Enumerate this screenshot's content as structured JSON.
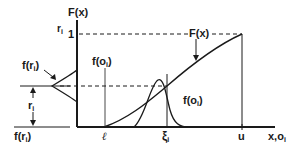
{
  "figure": {
    "type": "cdf-transformation-diagram",
    "labels": {
      "y_axis_title": "F(x)",
      "y_axis_secondary": "r",
      "y_axis_secondary_sub": "i",
      "y_max_tick": "1",
      "curve_label": "F(x)",
      "left_density_label_top": "f(r",
      "left_density_label_top_sub": "i",
      "left_density_label_top_close": ")",
      "left_density_label_bottom": "f(r",
      "left_density_label_bottom_sub": "i",
      "left_density_label_bottom_close": ")",
      "interval_label": "r",
      "interval_label_sub": "i",
      "density_label_upper": "f(o",
      "density_label_upper_sub": "i",
      "density_label_upper_close": ")",
      "density_label_right": "f(o",
      "density_label_right_sub": "i",
      "density_label_right_close": ")",
      "x_tick_lower": "ℓ",
      "x_tick_xi": "ξ",
      "x_tick_xi_sub": "i",
      "x_tick_upper": "u",
      "x_axis_title": "x,o",
      "x_axis_title_sub": "i"
    },
    "colors": {
      "ink": "#1a1a1a",
      "background": "#ffffff"
    }
  }
}
